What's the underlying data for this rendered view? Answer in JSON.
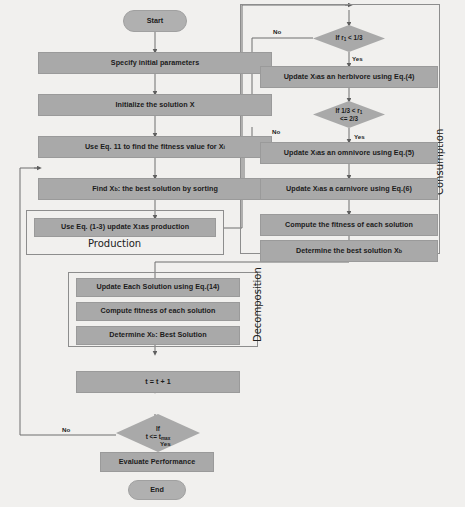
{
  "diagram": {
    "background_color": "#f1f0ee",
    "node_fill": "#a9a9a9",
    "node_border": "#9a9a9a",
    "line_color": "#6f6f6f"
  },
  "nodes": {
    "start": "Start",
    "specify_params": "Specify initial parameters",
    "initialize_solution": "Initialize the solution X",
    "fitness_eq11": "Use Eq. 11 to find the fitness value for Xi",
    "find_best": "Find Xb: the best solution by sorting",
    "production": "Use Eq. (1-3) update X1 as production",
    "herbivore": "Update Xi as an herbivore using Eq.(4)",
    "omnivore": "Update Xi as an omnivore using Eq.(5)",
    "carnivore": "Update Xi as a carnivore using Eq.(6)",
    "compute_fitness_consumption": "Compute the fitness of each solution",
    "determine_best_consumption": "Determine the best solution Xb",
    "update_eq14": "Update Each Solution using Eq.(14)",
    "compute_fitness_decomp": "Compute fitness of each solution",
    "determine_best_decomp": "Determine Xb : Best Solution",
    "increment": "t = t + 1",
    "evaluate": "Evaluate Performance",
    "end": "End"
  },
  "decisions": {
    "r1_lt_third": {
      "line1": "If r1 < 1/3",
      "line2": ""
    },
    "r1_between": {
      "line1": "If 1/3 < r1",
      "line2": "<= 2/3"
    },
    "t_le_tmax": {
      "line1": "If",
      "line2": "t <= tmax"
    }
  },
  "groups": {
    "production": "Production",
    "consumption": "Consumption",
    "decomposition": "Decomposition"
  },
  "edge_labels": {
    "no_1": "No",
    "yes_1": "Yes",
    "no_2": "No",
    "yes_2": "Yes",
    "no_3": "No",
    "yes_3": "Yes"
  }
}
